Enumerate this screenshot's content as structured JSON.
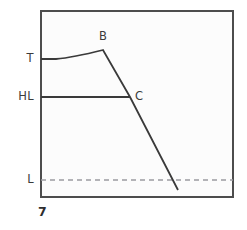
{
  "figure": {
    "number": "7",
    "background_color": "#ffffff",
    "plot_background_color": "#fcfcfc",
    "frame_color": "#4d4d4d",
    "curve_color": "#3a3a3a",
    "dashed_color": "#9a9aa0"
  },
  "axis_labels": [
    {
      "id": "T",
      "text": "T",
      "value_y": 59
    },
    {
      "id": "HL",
      "text": "HL",
      "value_y": 97
    },
    {
      "id": "L",
      "text": "L",
      "value_y": 180
    }
  ],
  "point_labels": [
    {
      "id": "B",
      "text": "B",
      "x": 103,
      "y": 50
    },
    {
      "id": "C",
      "text": "C",
      "x": 130,
      "y": 97
    }
  ],
  "chart_data": {
    "type": "line",
    "title": "",
    "xlabel": "",
    "ylabel": "",
    "grid": false,
    "legend": null,
    "axis_ticks_y": [
      "T",
      "HL",
      "L"
    ],
    "axis_ticks_x": [],
    "plot_area": {
      "x0": 41,
      "y0": 11,
      "x1": 233,
      "y1": 197
    },
    "series": [
      {
        "name": "temperature-curve",
        "style": "solid",
        "description": "Flat at T then rising curve to peak B, then steep straight descent through C and below L",
        "points": [
          {
            "x": 41,
            "y": 59
          },
          {
            "x": 56,
            "y": 59
          },
          {
            "x": 68,
            "y": 58
          },
          {
            "x": 78,
            "y": 56
          },
          {
            "x": 87,
            "y": 54
          },
          {
            "x": 95,
            "y": 52
          },
          {
            "x": 103,
            "y": 50
          },
          {
            "x": 130,
            "y": 97
          },
          {
            "x": 178,
            "y": 190
          }
        ]
      },
      {
        "name": "hl-level-line",
        "style": "solid",
        "description": "Horizontal reference line at level HL from left frame to intersection point C",
        "points": [
          {
            "x": 41,
            "y": 97
          },
          {
            "x": 130,
            "y": 97
          }
        ]
      },
      {
        "name": "l-level-line",
        "style": "dashed",
        "description": "Horizontal dashed reference line at level L spanning the full plot width",
        "points": [
          {
            "x": 41,
            "y": 180
          },
          {
            "x": 233,
            "y": 180
          }
        ]
      }
    ],
    "markers": [
      {
        "label": "B",
        "x": 103,
        "y": 50,
        "description": "Peak of the curve"
      },
      {
        "label": "C",
        "x": 130,
        "y": 97,
        "description": "Intersection of descending line with HL level"
      }
    ]
  }
}
